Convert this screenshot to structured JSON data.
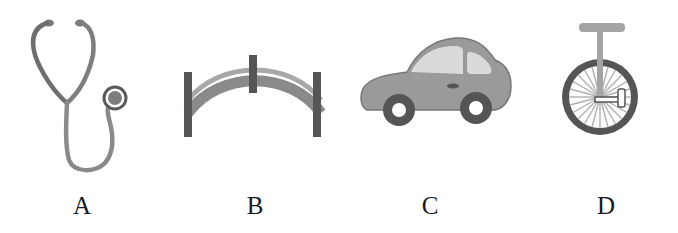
{
  "figure": {
    "options": [
      {
        "label": "A",
        "icon": "stethoscope-icon"
      },
      {
        "label": "B",
        "icon": "arch-bridge-icon"
      },
      {
        "label": "C",
        "icon": "car-icon"
      },
      {
        "label": "D",
        "icon": "unicycle-icon"
      }
    ],
    "colors": {
      "dark_gray": "#555555",
      "mid_gray": "#8a8a8a",
      "light_gray": "#b4b4b4",
      "very_light_gray": "#dcdcdc",
      "background": "#ffffff"
    }
  }
}
